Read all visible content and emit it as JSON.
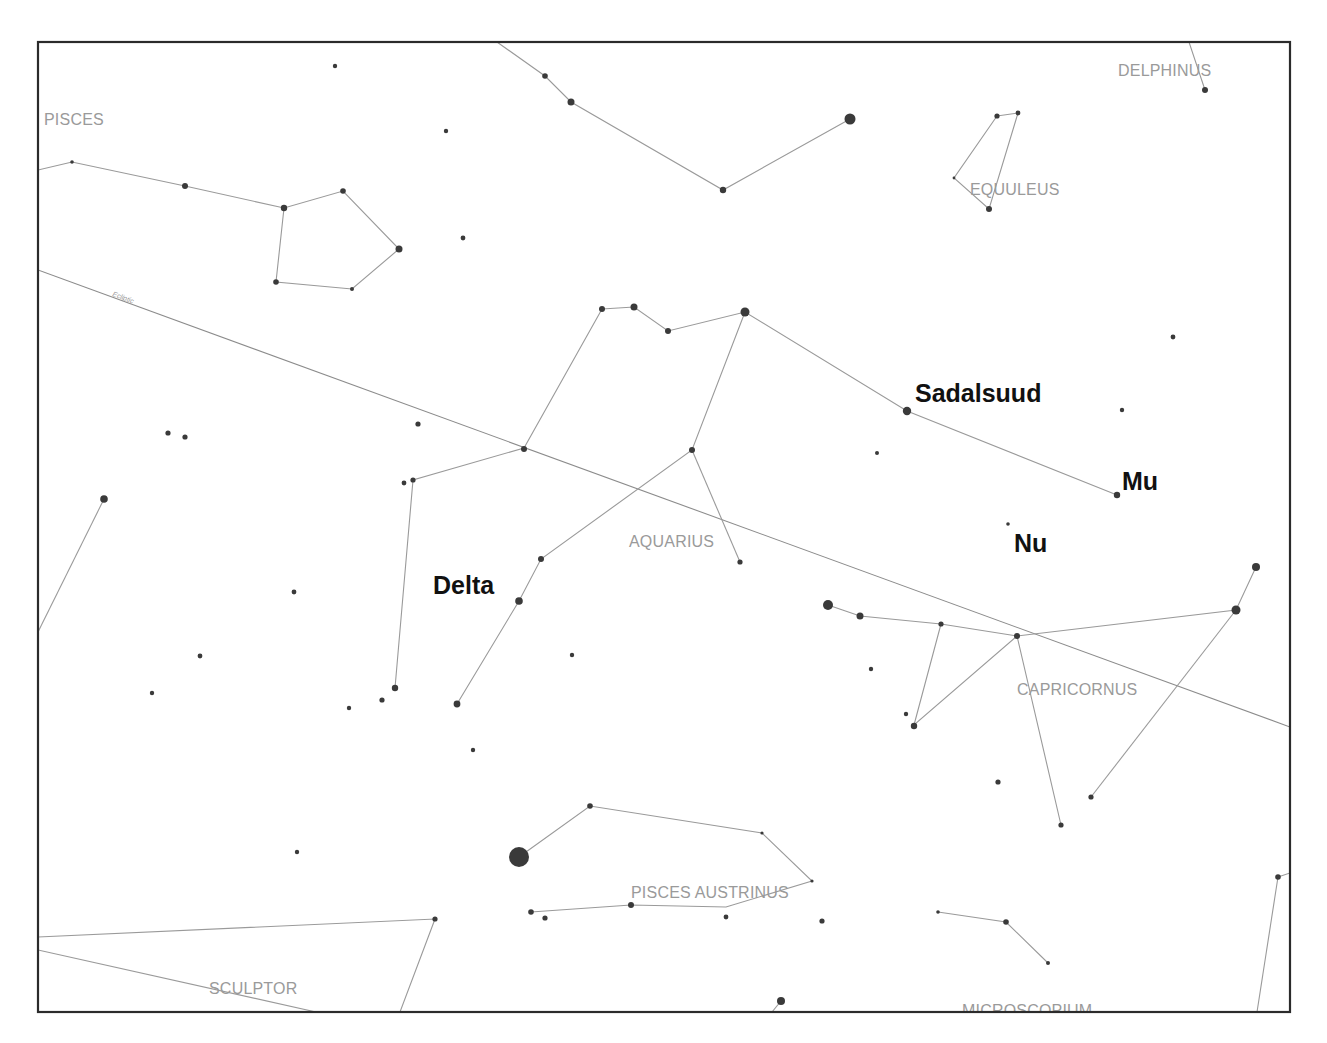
{
  "map": {
    "title": "Star chart: Aquarius region",
    "frame": {
      "x": 38,
      "y": 42,
      "w": 1252,
      "h": 970
    },
    "colors": {
      "frame": "#2b2b2b",
      "lines": "#9a9a9a",
      "stars": "#3a3a3a",
      "constellation_labels": "#9a9a9a",
      "star_labels": "#111111"
    },
    "ecliptic": {
      "label": "Ecliptic",
      "x1": 38,
      "y1": 270,
      "x2": 1290,
      "y2": 727,
      "label_x": 112,
      "label_y": 296,
      "label_angle": 20
    }
  },
  "constellation_labels": [
    {
      "text": "PISCES",
      "x": 44,
      "y": 125
    },
    {
      "text": "DELPHINUS",
      "x": 1118,
      "y": 76
    },
    {
      "text": "EQUULEUS",
      "x": 970,
      "y": 195
    },
    {
      "text": "AQUARIUS",
      "x": 629,
      "y": 547
    },
    {
      "text": "CAPRICORNUS",
      "x": 1017,
      "y": 695
    },
    {
      "text": "PISCES AUSTRINUS",
      "x": 631,
      "y": 898
    },
    {
      "text": "SCULPTOR",
      "x": 209,
      "y": 994
    },
    {
      "text": "MICROSCOPIUM",
      "x": 962,
      "y": 1016
    }
  ],
  "star_labels": [
    {
      "text": "Sadalsuud",
      "x": 915,
      "y": 402
    },
    {
      "text": "Mu",
      "x": 1122,
      "y": 490
    },
    {
      "text": "Nu",
      "x": 1014,
      "y": 552
    },
    {
      "text": "Delta",
      "x": 433,
      "y": 594
    }
  ],
  "lines": [
    [
      [
        38,
        170
      ],
      [
        72,
        162
      ],
      [
        185,
        186
      ],
      [
        284,
        208
      ],
      [
        343,
        191
      ],
      [
        399,
        249
      ],
      [
        352,
        289
      ],
      [
        276,
        282
      ],
      [
        284,
        208
      ]
    ],
    [
      [
        497,
        42
      ],
      [
        545,
        76
      ],
      [
        571,
        102
      ],
      [
        723,
        190
      ],
      [
        850,
        119
      ]
    ],
    [
      [
        1189,
        42
      ],
      [
        1205,
        90
      ]
    ],
    [
      [
        997,
        116
      ],
      [
        1018,
        113
      ],
      [
        989,
        209
      ],
      [
        954,
        178
      ],
      [
        997,
        116
      ]
    ],
    [
      [
        602,
        309
      ],
      [
        634,
        307
      ],
      [
        668,
        331
      ],
      [
        745,
        312
      ],
      [
        907,
        411
      ],
      [
        1117,
        495
      ]
    ],
    [
      [
        602,
        309
      ],
      [
        524,
        448
      ],
      [
        413,
        480
      ],
      [
        395,
        688
      ]
    ],
    [
      [
        745,
        312
      ],
      [
        692,
        450
      ],
      [
        541,
        559
      ],
      [
        519,
        601
      ],
      [
        457,
        704
      ]
    ],
    [
      [
        692,
        450
      ],
      [
        740,
        562
      ]
    ],
    [
      [
        38,
        632
      ],
      [
        104,
        499
      ]
    ],
    [
      [
        828,
        605
      ],
      [
        860,
        616
      ],
      [
        941,
        624
      ],
      [
        1017,
        636
      ],
      [
        1236,
        610
      ],
      [
        1256,
        567
      ]
    ],
    [
      [
        941,
        624
      ],
      [
        914,
        725
      ],
      [
        1017,
        636
      ],
      [
        1061,
        825
      ]
    ],
    [
      [
        1236,
        610
      ],
      [
        1091,
        797
      ]
    ],
    [
      [
        519,
        857
      ],
      [
        590,
        806
      ],
      [
        762,
        833
      ],
      [
        812,
        881
      ],
      [
        726,
        907
      ],
      [
        631,
        905
      ],
      [
        531,
        912
      ]
    ],
    [
      [
        38,
        937
      ],
      [
        435,
        919
      ],
      [
        400,
        1012
      ]
    ],
    [
      [
        38,
        950
      ],
      [
        316,
        1012
      ]
    ],
    [
      [
        938,
        912
      ],
      [
        1006,
        922
      ],
      [
        1048,
        963
      ]
    ],
    [
      [
        1278,
        877
      ],
      [
        1257,
        1012
      ]
    ],
    [
      [
        1278,
        877
      ],
      [
        1290,
        873
      ]
    ],
    [
      [
        781,
        1001
      ],
      [
        772,
        1012
      ]
    ]
  ],
  "stars": [
    {
      "x": 335,
      "y": 66,
      "r": 2.2
    },
    {
      "x": 446,
      "y": 131,
      "r": 2.2
    },
    {
      "x": 463,
      "y": 238,
      "r": 2.4
    },
    {
      "x": 72,
      "y": 162,
      "r": 1.8
    },
    {
      "x": 185,
      "y": 186,
      "r": 3
    },
    {
      "x": 284,
      "y": 208,
      "r": 3.2
    },
    {
      "x": 343,
      "y": 191,
      "r": 2.8
    },
    {
      "x": 399,
      "y": 249,
      "r": 3.5
    },
    {
      "x": 352,
      "y": 289,
      "r": 2
    },
    {
      "x": 276,
      "y": 282,
      "r": 2.8
    },
    {
      "x": 545,
      "y": 76,
      "r": 2.8
    },
    {
      "x": 571,
      "y": 102,
      "r": 3.5
    },
    {
      "x": 723,
      "y": 190,
      "r": 3.2
    },
    {
      "x": 850,
      "y": 119,
      "r": 5.5
    },
    {
      "x": 1205,
      "y": 90,
      "r": 3
    },
    {
      "x": 997,
      "y": 116,
      "r": 2.6
    },
    {
      "x": 1018,
      "y": 113,
      "r": 2.4
    },
    {
      "x": 954,
      "y": 178,
      "r": 1.4
    },
    {
      "x": 989,
      "y": 209,
      "r": 3
    },
    {
      "x": 1173,
      "y": 337,
      "r": 2.4
    },
    {
      "x": 1122,
      "y": 410,
      "r": 2.2
    },
    {
      "x": 877,
      "y": 453,
      "r": 2
    },
    {
      "x": 602,
      "y": 309,
      "r": 3
    },
    {
      "x": 634,
      "y": 307,
      "r": 3.5
    },
    {
      "x": 668,
      "y": 331,
      "r": 3
    },
    {
      "x": 745,
      "y": 312,
      "r": 4.5
    },
    {
      "x": 907,
      "y": 411,
      "r": 4.2
    },
    {
      "x": 1117,
      "y": 495,
      "r": 3.2
    },
    {
      "x": 1008,
      "y": 524,
      "r": 1.8
    },
    {
      "x": 524,
      "y": 449,
      "r": 3
    },
    {
      "x": 418,
      "y": 424,
      "r": 2.6
    },
    {
      "x": 404,
      "y": 483,
      "r": 2.4
    },
    {
      "x": 413,
      "y": 480,
      "r": 2.6
    },
    {
      "x": 692,
      "y": 450,
      "r": 3
    },
    {
      "x": 740,
      "y": 562,
      "r": 2.6
    },
    {
      "x": 541,
      "y": 559,
      "r": 3
    },
    {
      "x": 519,
      "y": 601,
      "r": 3.8
    },
    {
      "x": 457,
      "y": 704,
      "r": 3.4
    },
    {
      "x": 168,
      "y": 433,
      "r": 2.6
    },
    {
      "x": 185,
      "y": 437,
      "r": 2.6
    },
    {
      "x": 104,
      "y": 499,
      "r": 3.8
    },
    {
      "x": 294,
      "y": 592,
      "r": 2.4
    },
    {
      "x": 200,
      "y": 656,
      "r": 2.4
    },
    {
      "x": 152,
      "y": 693,
      "r": 2.2
    },
    {
      "x": 395,
      "y": 688,
      "r": 3.2
    },
    {
      "x": 382,
      "y": 700,
      "r": 2.6
    },
    {
      "x": 349,
      "y": 708,
      "r": 2.2
    },
    {
      "x": 473,
      "y": 750,
      "r": 2.2
    },
    {
      "x": 572,
      "y": 655,
      "r": 2.2
    },
    {
      "x": 828,
      "y": 605,
      "r": 5
    },
    {
      "x": 860,
      "y": 616,
      "r": 3.5
    },
    {
      "x": 941,
      "y": 624,
      "r": 2.6
    },
    {
      "x": 1017,
      "y": 636,
      "r": 3
    },
    {
      "x": 1236,
      "y": 610,
      "r": 4.5
    },
    {
      "x": 1256,
      "y": 567,
      "r": 4
    },
    {
      "x": 871,
      "y": 669,
      "r": 2.2
    },
    {
      "x": 906,
      "y": 714,
      "r": 2.2
    },
    {
      "x": 914,
      "y": 726,
      "r": 3.2
    },
    {
      "x": 998,
      "y": 782,
      "r": 2.6
    },
    {
      "x": 1061,
      "y": 825,
      "r": 2.6
    },
    {
      "x": 1091,
      "y": 797,
      "r": 2.6
    },
    {
      "x": 297,
      "y": 852,
      "r": 2.2
    },
    {
      "x": 519,
      "y": 857,
      "r": 10
    },
    {
      "x": 590,
      "y": 806,
      "r": 2.8
    },
    {
      "x": 762,
      "y": 833,
      "r": 1.6
    },
    {
      "x": 812,
      "y": 881,
      "r": 1.6
    },
    {
      "x": 531,
      "y": 912,
      "r": 2.8
    },
    {
      "x": 545,
      "y": 918,
      "r": 2.6
    },
    {
      "x": 631,
      "y": 905,
      "r": 3
    },
    {
      "x": 726,
      "y": 917,
      "r": 2.4
    },
    {
      "x": 822,
      "y": 921,
      "r": 2.6
    },
    {
      "x": 435,
      "y": 919,
      "r": 2.6
    },
    {
      "x": 938,
      "y": 912,
      "r": 1.8
    },
    {
      "x": 1006,
      "y": 922,
      "r": 2.8
    },
    {
      "x": 1048,
      "y": 963,
      "r": 2
    },
    {
      "x": 1278,
      "y": 877,
      "r": 2.8
    },
    {
      "x": 781,
      "y": 1001,
      "r": 4
    }
  ]
}
